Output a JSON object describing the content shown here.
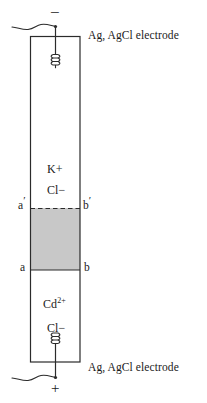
{
  "figure": {
    "terminals": {
      "top_sign": "−",
      "bottom_sign": "+"
    },
    "captions": {
      "top_electrode": "Ag, AgCl electrode",
      "bottom_electrode": "Ag, AgCl electrode"
    },
    "upper_chamber": {
      "species": [
        {
          "formula": "K",
          "charge": "+"
        },
        {
          "formula": "Cl",
          "charge": "−"
        }
      ],
      "ion_1_text": "K+",
      "ion_2_text": "Cl−"
    },
    "lower_chamber": {
      "species": [
        {
          "formula": "Cd",
          "charge": "2+"
        },
        {
          "formula": "Cl",
          "charge": "−"
        }
      ],
      "ion_1_base": "Cd",
      "ion_1_charge": "2+",
      "ion_2_text": "Cl−"
    },
    "boundaries": {
      "upper_left_label": "a",
      "upper_left_prime": "′",
      "upper_right_label": "b",
      "upper_right_prime": "′",
      "lower_left_label": "a",
      "lower_right_label": "b",
      "upper_line_style": "dashed",
      "lower_line_style": "solid"
    },
    "junction_region": {
      "fill_color": "#c8c8c8",
      "description": "transition region"
    },
    "colors": {
      "stroke": "#2b2b2b",
      "background": "#ffffff",
      "gray_fill": "#c8c8c8",
      "text": "#1a1a1a"
    }
  }
}
